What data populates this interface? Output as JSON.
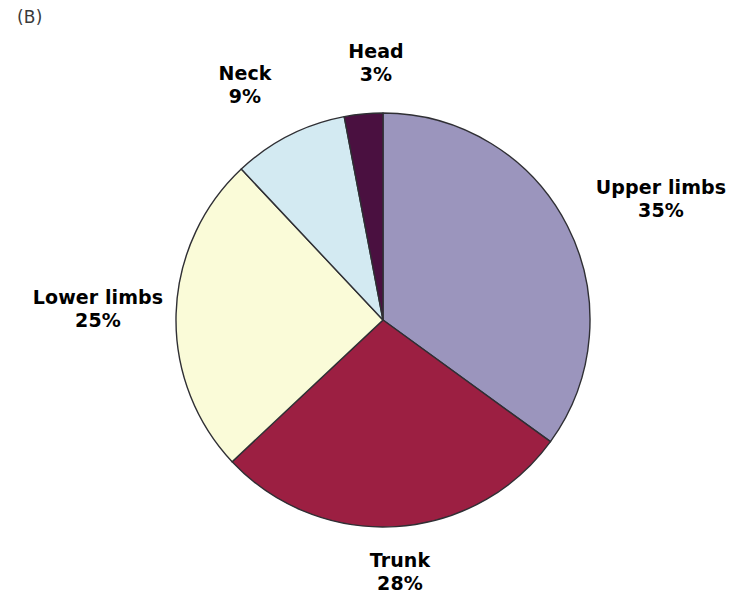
{
  "panel": {
    "label": "(B)"
  },
  "chart_data": {
    "type": "pie",
    "title": "",
    "subtitle": "",
    "xlabel": "",
    "ylabel": "",
    "legend_position": "none",
    "grid": false,
    "labels_inline": true,
    "value_unit": "%",
    "start_angle_deg": 0,
    "direction": "clockwise",
    "categories": [
      "Upper limbs",
      "Trunk",
      "Lower limbs",
      "Neck",
      "Head"
    ],
    "values": [
      35,
      28,
      25,
      9,
      3
    ],
    "colors": [
      "#9b95bd",
      "#9c1f42",
      "#fafbd8",
      "#d3eaf2",
      "#4a1040"
    ],
    "slices": [
      {
        "name": "Upper limbs",
        "value": 35,
        "value_text": "35%",
        "color": "#9b95bd",
        "label_position": "right"
      },
      {
        "name": "Trunk",
        "value": 28,
        "value_text": "28%",
        "color": "#9c1f42",
        "label_position": "bottom"
      },
      {
        "name": "Lower limbs",
        "value": 25,
        "value_text": "25%",
        "color": "#fafbd8",
        "label_position": "left"
      },
      {
        "name": "Neck",
        "value": 9,
        "value_text": "9%",
        "color": "#d3eaf2",
        "label_position": "top-left"
      },
      {
        "name": "Head",
        "value": 3,
        "value_text": "3%",
        "color": "#4a1040",
        "label_position": "top"
      }
    ],
    "geometry": {
      "center_x": 383,
      "center_y": 320,
      "radius": 207,
      "stroke_color": "#2f2f34"
    }
  }
}
